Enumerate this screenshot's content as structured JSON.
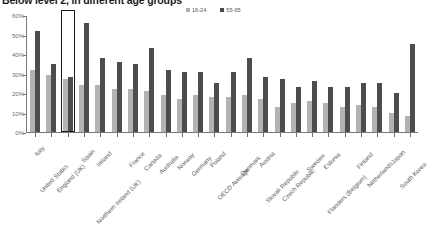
{
  "chart_data": {
    "type": "bar",
    "title": "Below level 2, in different age groups",
    "xlabel": "",
    "ylabel": "",
    "ylim": [
      0,
      60
    ],
    "ytick_labels": [
      "0%",
      "10%",
      "20%",
      "30%",
      "40%",
      "50%",
      "60%"
    ],
    "ytick_values": [
      0,
      10,
      20,
      30,
      40,
      50,
      60
    ],
    "grid": false,
    "legend_position": "top-right",
    "categories": [
      "Italy",
      "United States",
      "England (UK)",
      "Spain",
      "Ireland",
      "Northern Ireland (UK)",
      "France",
      "Canada",
      "Australia",
      "Norway",
      "Germany",
      "Poland",
      "OECD Average",
      "Denmark",
      "Austria",
      "Slovak Republic",
      "Czech Republic",
      "Sweden",
      "Estonia",
      "Flanders (Belgium)",
      "Finland",
      "Netherlands",
      "Japan",
      "South Korea"
    ],
    "series": [
      {
        "name": "16-24",
        "color": "#b3b3b3",
        "values": [
          32,
          29,
          27,
          24,
          24,
          22,
          22,
          21,
          19,
          17,
          19,
          18,
          18,
          19,
          17,
          13,
          15,
          16,
          15,
          13,
          14,
          13,
          10,
          8
        ]
      },
      {
        "name": "55-65",
        "color": "#4d4d4d",
        "values": [
          52,
          35,
          28,
          56,
          38,
          36,
          35,
          43,
          32,
          31,
          31,
          25,
          31,
          38,
          28,
          27,
          23,
          26,
          23,
          23,
          25,
          25,
          20,
          45
        ]
      }
    ],
    "highlight": {
      "category": "England (UK)",
      "index": 2,
      "style": "black-outline-box"
    }
  },
  "legend": {
    "entries": [
      {
        "label": "16-24",
        "swatch": "legend-swatch-16-24"
      },
      {
        "label": "55-65",
        "swatch": "legend-swatch-55-65"
      }
    ]
  },
  "colors": {
    "series_young": "#b3b3b3",
    "series_old": "#4d4d4d",
    "axis": "#7a7a7a",
    "title": "#1c1c1c",
    "tick_text": "#6b6b6b",
    "highlight_outline": "#1a1a1a"
  }
}
